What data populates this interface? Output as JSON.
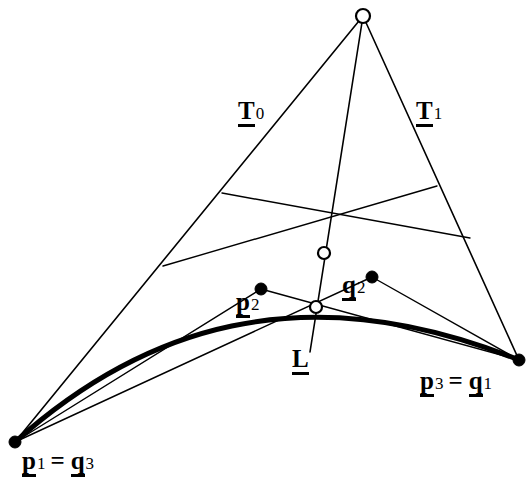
{
  "figure": {
    "type": "geometric-diagram",
    "background_color": "#ffffff",
    "stroke_color": "#000000",
    "width": 531,
    "height": 488
  },
  "labels": {
    "t0": {
      "base": "T",
      "sub": "0"
    },
    "t1": {
      "base": "T",
      "sub": "1"
    },
    "l": {
      "base": "L",
      "sub": ""
    },
    "p2": {
      "base": "p",
      "sub": "2"
    },
    "q2": {
      "base": "q",
      "sub": "2"
    },
    "p1_eq_q3": {
      "base_a": "p",
      "sub_a": "1",
      "eq": "=",
      "base_b": "q",
      "sub_b": "3"
    },
    "p3_eq_q1": {
      "base_a": "p",
      "sub_a": "3",
      "eq": "=",
      "base_b": "q",
      "sub_b": "1"
    }
  },
  "chart_data": {
    "type": "scatter",
    "title": "",
    "xlabel": "",
    "ylabel": "",
    "xlim": [
      0,
      531
    ],
    "ylim": [
      0,
      488
    ],
    "grid": false,
    "legend": "none",
    "points": [
      {
        "name": "apex",
        "x": 363,
        "y": 16,
        "style": "open-circle",
        "radius": 7
      },
      {
        "name": "p1_eq_q3",
        "x": 15,
        "y": 442,
        "style": "filled-dot",
        "radius": 6
      },
      {
        "name": "p3_eq_q1",
        "x": 519,
        "y": 360,
        "style": "filled-dot",
        "radius": 6
      },
      {
        "name": "p2",
        "x": 261,
        "y": 289,
        "style": "filled-dot",
        "radius": 6
      },
      {
        "name": "q2",
        "x": 372,
        "y": 277,
        "style": "filled-dot",
        "radius": 6
      },
      {
        "name": "intersection-upper",
        "x": 324,
        "y": 253,
        "style": "open-circle",
        "radius": 6
      },
      {
        "name": "intersection-lower",
        "x": 316,
        "y": 307,
        "style": "open-circle",
        "radius": 6
      }
    ],
    "segments": [
      {
        "name": "tangent-T0",
        "from": [
          363,
          16
        ],
        "to": [
          15,
          442
        ],
        "weight": 1.6
      },
      {
        "name": "tangent-T1",
        "from": [
          363,
          16
        ],
        "to": [
          519,
          360
        ],
        "weight": 1.6
      },
      {
        "name": "line-L",
        "from": [
          363,
          16
        ],
        "to": [
          310,
          352
        ],
        "weight": 1.6
      },
      {
        "name": "chord-left-hull",
        "from": [
          15,
          442
        ],
        "to": [
          261,
          289
        ],
        "weight": 1.4
      },
      {
        "name": "chord-right-hull",
        "from": [
          261,
          289
        ],
        "to": [
          519,
          360
        ],
        "weight": 1.4
      },
      {
        "name": "chord-q",
        "from": [
          15,
          442
        ],
        "to": [
          372,
          277
        ],
        "weight": 1.4
      },
      {
        "name": "chord-q-right",
        "from": [
          372,
          277
        ],
        "to": [
          519,
          360
        ],
        "weight": 1.4
      },
      {
        "name": "rib-left-upper",
        "from": [
          222,
          193
        ],
        "to": [
          470,
          238
        ],
        "weight": 1.4
      },
      {
        "name": "rib-left-lower",
        "from": [
          163,
          266
        ],
        "to": [
          437,
          186
        ],
        "weight": 1.4
      }
    ],
    "curves": [
      {
        "name": "bezier-curve",
        "weight": 5,
        "path": [
          [
            15,
            442
          ],
          [
            140,
            330
          ],
          [
            300,
            272
          ],
          [
            519,
            360
          ]
        ]
      }
    ],
    "label_positions": [
      {
        "name": "t0",
        "x": 238,
        "y": 98
      },
      {
        "name": "t1",
        "x": 416,
        "y": 98
      },
      {
        "name": "l",
        "x": 292,
        "y": 346
      },
      {
        "name": "p2",
        "x": 236,
        "y": 289
      },
      {
        "name": "q2",
        "x": 342,
        "y": 272
      },
      {
        "name": "p1_eq_q3",
        "x": 22,
        "y": 448
      },
      {
        "name": "p3_eq_q1",
        "x": 420,
        "y": 368
      }
    ]
  }
}
